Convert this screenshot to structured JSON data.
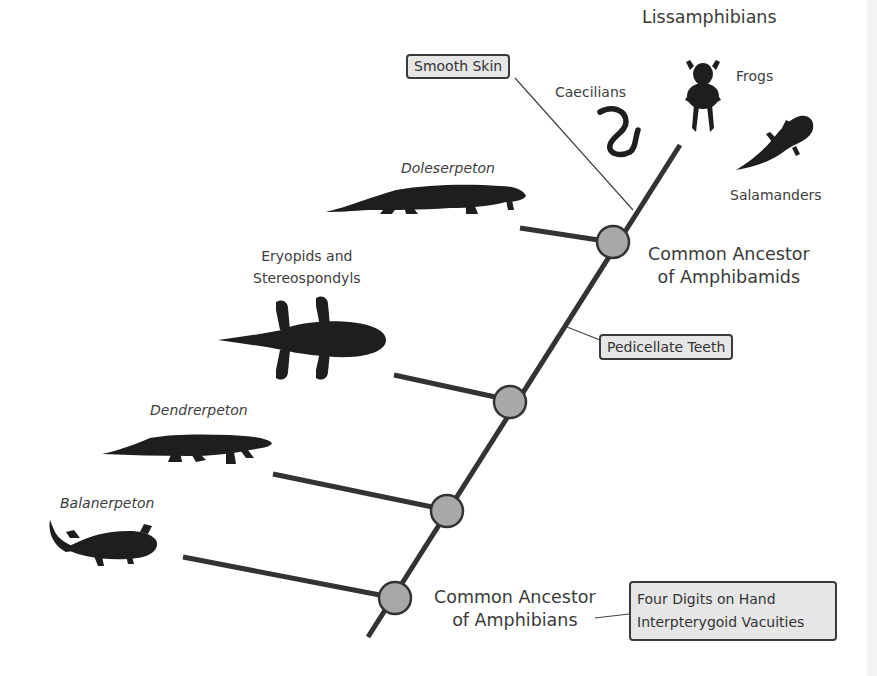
{
  "diagram": {
    "type": "cladogram",
    "colors": {
      "branch": "#333333",
      "node_fill": "#a8a8a8",
      "node_stroke": "#333333",
      "trait_box_fill": "#e6e6e6",
      "text": "#3a3a3a",
      "silhouette": "#1e1e1e"
    },
    "group_label": "Lissamphibians",
    "taxa": [
      {
        "id": "frogs",
        "label": "Frogs",
        "italic": false,
        "icon": "frog-silhouette-icon"
      },
      {
        "id": "caecilians",
        "label": "Caecilians",
        "italic": false,
        "icon": "caecilian-silhouette-icon"
      },
      {
        "id": "salamanders",
        "label": "Salamanders",
        "italic": false,
        "icon": "salamander-silhouette-icon"
      },
      {
        "id": "doleserpeton",
        "label": "Doleserpeton",
        "italic": true,
        "icon": "doleserpeton-silhouette-icon"
      },
      {
        "id": "eryopids",
        "label_line1": "Eryopids and",
        "label_line2": "Stereospondyls",
        "italic": false,
        "icon": "eryopid-silhouette-icon"
      },
      {
        "id": "dendrerpeton",
        "label": "Dendrerpeton",
        "italic": true,
        "icon": "dendrerpeton-silhouette-icon"
      },
      {
        "id": "balanerpeton",
        "label": "Balanerpeton",
        "italic": true,
        "icon": "balanerpeton-silhouette-icon"
      }
    ],
    "nodes": [
      {
        "id": "amphibamids",
        "label_line1": "Common Ancestor",
        "label_line2": "of Amphibamids"
      },
      {
        "id": "eryopid-node"
      },
      {
        "id": "dendrerpeton-node"
      },
      {
        "id": "amphibians",
        "label_line1": "Common Ancestor",
        "label_line2": "of Amphibians"
      }
    ],
    "traits": [
      {
        "id": "smooth-skin",
        "label": "Smooth Skin"
      },
      {
        "id": "pedicellate-teeth",
        "label": "Pedicellate Teeth"
      },
      {
        "id": "four-digits",
        "label_line1": "Four Digits on Hand",
        "label_line2": "Interpterygoid Vacuities"
      }
    ]
  }
}
